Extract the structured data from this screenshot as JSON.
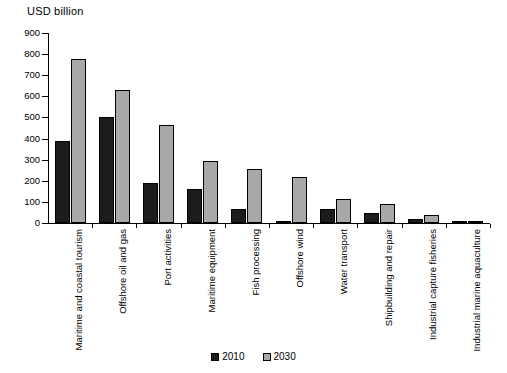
{
  "chart_data": {
    "type": "bar",
    "title": "USD billion",
    "xlabel": "",
    "ylabel": "USD billion",
    "ylim": [
      0,
      900
    ],
    "yticks": [
      0,
      100,
      200,
      300,
      400,
      500,
      600,
      700,
      800,
      900
    ],
    "ytick_labels": [
      "0",
      "100",
      "200",
      "300",
      "400",
      "500",
      "600",
      "700",
      "800",
      "900"
    ],
    "grid": false,
    "legend_position": "bottom-center",
    "categories": [
      "Maritime and coastal tourism",
      "Offshore oil and gas",
      "Port activities",
      "Maritime equipment",
      "Fish processing",
      "Offshore wind",
      "Water transport",
      "Shipbuilding and repair",
      "Industrial capture fisheries",
      "Industrial marine aquaculture"
    ],
    "series": [
      {
        "name": "2010",
        "color": "#1c1c1c",
        "values": [
          390,
          504,
          190,
          163,
          67,
          3,
          67,
          47,
          18,
          3
        ]
      },
      {
        "name": "2030",
        "color": "#a8a8a8",
        "values": [
          777,
          630,
          465,
          296,
          256,
          218,
          112,
          91,
          39,
          7
        ]
      }
    ]
  },
  "legend": {
    "items": [
      {
        "label": "2010"
      },
      {
        "label": "2030"
      }
    ]
  },
  "colors": {
    "series_2010": "#1c1c1c",
    "series_2030": "#a8a8a8",
    "axis": "#000000",
    "background": "#ffffff"
  }
}
